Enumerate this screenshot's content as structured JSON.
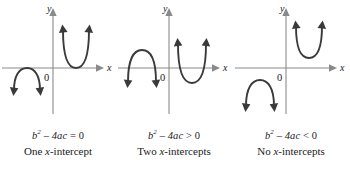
{
  "figure": {
    "background_color": "#ffffff",
    "curve_color": "#3a3a3a",
    "axis_color": "#8a8a8a",
    "text_color": "#1a1a1a"
  },
  "axis_labels": {
    "x": "x",
    "y": "y",
    "origin": "0"
  },
  "panels": [
    {
      "id": "one-intercept",
      "equation_lhs": "b",
      "equation_exp": "2",
      "equation_mid": "– 4ac",
      "equation_rel": "=",
      "equation_rhs": "0",
      "equation_full": "b² – 4ac = 0",
      "caption_prefix": "One ",
      "caption_italic": "x",
      "caption_suffix": "-intercept",
      "caption_full": "One x-intercept",
      "intercept_count": 1,
      "curves": [
        {
          "orientation": "opens-up",
          "vertex": [
            0.95,
            0.0
          ],
          "tangent_to_x_axis": true
        },
        {
          "orientation": "opens-down",
          "vertex": [
            -0.95,
            0.0
          ],
          "tangent_to_x_axis": true
        }
      ]
    },
    {
      "id": "two-intercepts",
      "equation_lhs": "b",
      "equation_exp": "2",
      "equation_mid": "– 4ac",
      "equation_rel": ">",
      "equation_rhs": "0",
      "equation_full": "b² – 4ac > 0",
      "caption_prefix": "Two ",
      "caption_italic": "x",
      "caption_suffix": "-intercepts",
      "caption_full": "Two x-intercepts",
      "intercept_count": 2,
      "curves": [
        {
          "orientation": "opens-up",
          "vertex": [
            0.95,
            -0.45
          ],
          "crosses_x_axis_twice": true
        },
        {
          "orientation": "opens-down",
          "vertex": [
            -0.95,
            0.45
          ],
          "crosses_x_axis_twice": true
        }
      ]
    },
    {
      "id": "no-intercepts",
      "equation_lhs": "b",
      "equation_exp": "2",
      "equation_mid": "– 4ac",
      "equation_rel": "<",
      "equation_rhs": "0",
      "equation_full": "b² – 4ac < 0",
      "caption_prefix": "No ",
      "caption_italic": "x",
      "caption_suffix": "-intercepts",
      "caption_full": "No x-intercepts",
      "intercept_count": 0,
      "curves": [
        {
          "orientation": "opens-up",
          "vertex": [
            0.95,
            0.4
          ],
          "crosses_x_axis_twice": false
        },
        {
          "orientation": "opens-down",
          "vertex": [
            -0.95,
            -0.4
          ],
          "crosses_x_axis_twice": false
        }
      ]
    }
  ]
}
